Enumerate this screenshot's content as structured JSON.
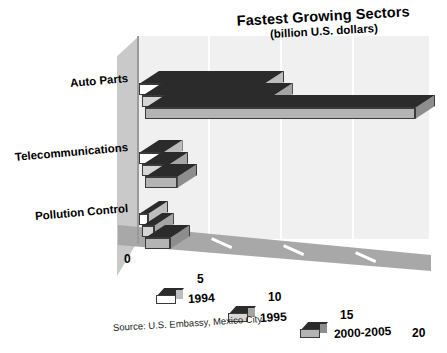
{
  "chart_data": {
    "type": "bar",
    "orientation": "horizontal",
    "style": "3d-isometric-grouped",
    "title": "Fastest Growing Sectors",
    "subtitle": "(billion U.S. dollars)",
    "xlabel": "",
    "ylabel": "",
    "unit": "billion U.S. dollars",
    "categories": [
      "Auto Parts",
      "Telecommunications",
      "Pollution Control"
    ],
    "series": [
      {
        "name": "1994",
        "values": [
          10.0,
          3.0,
          2.0
        ],
        "front_color": "#ffffff",
        "top_color": "#2b2b2b",
        "side_color": "#bdbdbd"
      },
      {
        "name": "1995",
        "values": [
          10.4,
          3.2,
          2.2
        ],
        "front_color": "#d6d6d6",
        "top_color": "#2b2b2b",
        "side_color": "#a5a5a5"
      },
      {
        "name": "2000-2005",
        "values": [
          20.0,
          3.6,
          3.1
        ],
        "front_color": "#b4b4b4",
        "top_color": "#2b2b2b",
        "side_color": "#8d8d8d"
      }
    ],
    "xticks": [
      0,
      5,
      10,
      15,
      20
    ],
    "xtick_labels": [
      "0",
      "5",
      "10",
      "15",
      "20"
    ],
    "xlim": [
      0,
      20
    ],
    "grid": true,
    "legend_position": "bottom",
    "source": "Source: U.S. Embassy, Mexico City",
    "background_color": "#ffffff",
    "plot_back_color": "#f0f0f0",
    "plot_floor_color": "#a8a8a8",
    "plot_side_color": "#c9c9c9"
  }
}
